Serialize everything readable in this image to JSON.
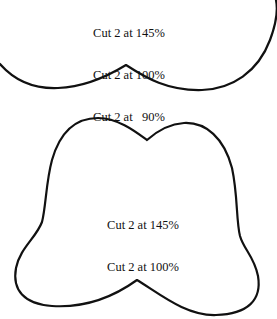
{
  "pattern_pieces": [
    {
      "name": "top-piece",
      "labels": [
        "Cut 2 at 145%",
        "Cut 2 at 100%",
        "Cut 2 at   90%"
      ]
    },
    {
      "name": "bottom-piece",
      "labels": [
        "Cut 2 at 145%",
        "Cut 2 at 100%"
      ]
    }
  ],
  "colors": {
    "outline": "#111111",
    "background": "#ffffff"
  }
}
